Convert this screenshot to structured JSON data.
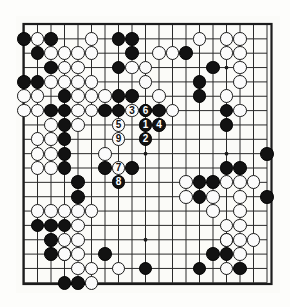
{
  "figure": {
    "kind": "go-board-diagram",
    "background_color": "#fdfdfb",
    "board": {
      "size": 19,
      "line_color": "#2b2b2b",
      "border_color": "#1c1c1c",
      "board_color": "#fbfbf8",
      "star_points": [
        [
          4,
          4
        ],
        [
          10,
          4
        ],
        [
          16,
          4
        ],
        [
          4,
          10
        ],
        [
          10,
          10
        ],
        [
          16,
          10
        ],
        [
          4,
          16
        ],
        [
          10,
          16
        ],
        [
          16,
          16
        ]
      ]
    },
    "stone_colors": {
      "black": "#121212",
      "white": "#fbfbfb",
      "white_outline": "#1a1a1a",
      "black_label": "#ffffff",
      "white_label": "#111111"
    },
    "black_stones": [
      [
        1,
        2
      ],
      [
        3,
        2
      ],
      [
        8,
        2
      ],
      [
        9,
        2
      ],
      [
        2,
        3
      ],
      [
        9,
        3
      ],
      [
        13,
        3
      ],
      [
        3,
        4
      ],
      [
        8,
        4
      ],
      [
        15,
        4
      ],
      [
        1,
        5
      ],
      [
        2,
        5
      ],
      [
        14,
        5
      ],
      [
        4,
        6
      ],
      [
        8,
        6
      ],
      [
        9,
        6
      ],
      [
        14,
        6
      ],
      [
        3,
        7
      ],
      [
        4,
        7
      ],
      [
        7,
        7
      ],
      [
        8,
        7
      ],
      [
        11,
        7
      ],
      [
        16,
        7
      ],
      [
        4,
        8
      ],
      [
        16,
        8
      ],
      [
        4,
        9
      ],
      [
        4,
        10
      ],
      [
        19,
        10
      ],
      [
        4,
        11
      ],
      [
        7,
        11
      ],
      [
        9,
        11
      ],
      [
        16,
        11
      ],
      [
        17,
        11
      ],
      [
        5,
        12
      ],
      [
        14,
        12
      ],
      [
        15,
        12
      ],
      [
        5,
        13
      ],
      [
        14,
        13
      ],
      [
        19,
        13
      ],
      [
        2,
        15
      ],
      [
        3,
        15
      ],
      [
        4,
        15
      ],
      [
        3,
        16
      ],
      [
        16,
        16
      ],
      [
        3,
        17
      ],
      [
        4,
        17
      ],
      [
        7,
        17
      ],
      [
        15,
        17
      ],
      [
        16,
        17
      ],
      [
        10,
        18
      ],
      [
        14,
        18
      ],
      [
        17,
        18
      ],
      [
        4,
        19
      ],
      [
        5,
        19
      ]
    ],
    "white_stones": [
      [
        2,
        2
      ],
      [
        6,
        2
      ],
      [
        14,
        2
      ],
      [
        16,
        2
      ],
      [
        17,
        2
      ],
      [
        3,
        3
      ],
      [
        4,
        3
      ],
      [
        5,
        3
      ],
      [
        6,
        3
      ],
      [
        11,
        3
      ],
      [
        12,
        3
      ],
      [
        16,
        3
      ],
      [
        17,
        3
      ],
      [
        4,
        4
      ],
      [
        5,
        4
      ],
      [
        9,
        4
      ],
      [
        10,
        4
      ],
      [
        17,
        4
      ],
      [
        3,
        5
      ],
      [
        4,
        5
      ],
      [
        5,
        5
      ],
      [
        6,
        5
      ],
      [
        10,
        5
      ],
      [
        17,
        5
      ],
      [
        1,
        6
      ],
      [
        2,
        6
      ],
      [
        5,
        6
      ],
      [
        6,
        6
      ],
      [
        7,
        6
      ],
      [
        11,
        6
      ],
      [
        16,
        6
      ],
      [
        1,
        7
      ],
      [
        2,
        7
      ],
      [
        5,
        7
      ],
      [
        6,
        7
      ],
      [
        10,
        7
      ],
      [
        12,
        7
      ],
      [
        17,
        7
      ],
      [
        3,
        8
      ],
      [
        5,
        8
      ],
      [
        2,
        9
      ],
      [
        3,
        9
      ],
      [
        2,
        10
      ],
      [
        3,
        10
      ],
      [
        7,
        10
      ],
      [
        2,
        11
      ],
      [
        3,
        11
      ],
      [
        13,
        12
      ],
      [
        16,
        12
      ],
      [
        17,
        12
      ],
      [
        18,
        12
      ],
      [
        13,
        13
      ],
      [
        15,
        13
      ],
      [
        17,
        13
      ],
      [
        2,
        14
      ],
      [
        3,
        14
      ],
      [
        4,
        14
      ],
      [
        5,
        14
      ],
      [
        6,
        14
      ],
      [
        15,
        14
      ],
      [
        17,
        14
      ],
      [
        5,
        15
      ],
      [
        16,
        15
      ],
      [
        17,
        15
      ],
      [
        4,
        16
      ],
      [
        5,
        16
      ],
      [
        16,
        16
      ],
      [
        17,
        16
      ],
      [
        18,
        16
      ],
      [
        4,
        17
      ],
      [
        5,
        17
      ],
      [
        17,
        17
      ],
      [
        5,
        18
      ],
      [
        6,
        18
      ],
      [
        8,
        18
      ],
      [
        16,
        18
      ],
      [
        6,
        19
      ]
    ],
    "moves": [
      {
        "number": "1",
        "color": "black",
        "col": 10,
        "row": 8
      },
      {
        "number": "2",
        "color": "black",
        "col": 10,
        "row": 9
      },
      {
        "number": "3",
        "color": "white",
        "col": 9,
        "row": 7
      },
      {
        "number": "4",
        "color": "black",
        "col": 11,
        "row": 8
      },
      {
        "number": "5",
        "color": "white",
        "col": 8,
        "row": 8
      },
      {
        "number": "6",
        "color": "black",
        "col": 10,
        "row": 7
      },
      {
        "number": "7",
        "color": "white",
        "col": 8,
        "row": 11
      },
      {
        "number": "8",
        "color": "black",
        "col": 8,
        "row": 12
      },
      {
        "number": "9",
        "color": "white",
        "col": 8,
        "row": 9
      }
    ]
  }
}
